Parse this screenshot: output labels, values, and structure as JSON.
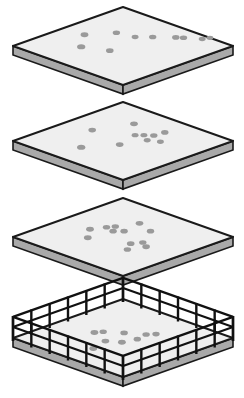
{
  "figure": {
    "title": "Stacked Isometric Platform Slabs",
    "canvas": {
      "width": 244,
      "height": 398
    },
    "colors": {
      "background": "#ffffff",
      "slab_top_fill": "#efefef",
      "slab_side_fill": "#a9a9a9",
      "outline": "#1a1a1a",
      "speck_fill": "#9a9a9a",
      "fence": "#111111"
    },
    "geometry": {
      "slab_half_width": 110,
      "slab_half_depth": 39,
      "slab_thickness": 9,
      "center_x": 123
    }
  },
  "chart_data": {
    "type": "diagram",
    "title": "Stacked Isometric Platform Slabs",
    "layers": [
      {
        "id": "slab-1",
        "label": "Top slab",
        "center_y": 46,
        "has_fence": false,
        "specks": [
          {
            "x": 0.47,
            "y": 0.18,
            "r": 3.4
          },
          {
            "x": 0.3,
            "y": 0.32,
            "r": 3.6
          },
          {
            "x": 0.64,
            "y": 0.3,
            "r": 3.2
          },
          {
            "x": 0.67,
            "y": 0.44,
            "r": 3.0
          },
          {
            "x": 0.38,
            "y": 0.5,
            "r": 3.3
          },
          {
            "x": 0.75,
            "y": 0.52,
            "r": 3.2
          },
          {
            "x": 0.85,
            "y": 0.63,
            "r": 3.2
          },
          {
            "x": 0.88,
            "y": 0.67,
            "r": 3.2
          },
          {
            "x": 0.95,
            "y": 0.77,
            "r": 3.0
          },
          {
            "x": 1.0,
            "y": 0.79,
            "r": 3.0
          }
        ]
      },
      {
        "id": "slab-2",
        "label": "Second slab",
        "center_y": 141,
        "has_fence": false,
        "specks": [
          {
            "x": 0.5,
            "y": 0.22,
            "r": 3.3
          },
          {
            "x": 0.23,
            "y": 0.39,
            "r": 3.6
          },
          {
            "x": 0.77,
            "y": 0.33,
            "r": 3.4
          },
          {
            "x": 0.44,
            "y": 0.53,
            "r": 3.3
          },
          {
            "x": 0.63,
            "y": 0.48,
            "r": 3.0
          },
          {
            "x": 0.67,
            "y": 0.52,
            "r": 3.0
          },
          {
            "x": 0.71,
            "y": 0.57,
            "r": 3.2
          },
          {
            "x": 0.62,
            "y": 0.6,
            "r": 3.0
          },
          {
            "x": 0.8,
            "y": 0.58,
            "r": 3.2
          },
          {
            "x": 0.66,
            "y": 0.68,
            "r": 3.0
          }
        ]
      },
      {
        "id": "slab-3",
        "label": "Third slab",
        "center_y": 237,
        "has_fence": false,
        "specks": [
          {
            "x": 0.45,
            "y": 0.25,
            "r": 3.4
          },
          {
            "x": 0.33,
            "y": 0.35,
            "r": 3.4
          },
          {
            "x": 0.55,
            "y": 0.3,
            "r": 3.2
          },
          {
            "x": 0.6,
            "y": 0.33,
            "r": 3.2
          },
          {
            "x": 0.53,
            "y": 0.38,
            "r": 3.2
          },
          {
            "x": 0.58,
            "y": 0.43,
            "r": 3.2
          },
          {
            "x": 0.75,
            "y": 0.4,
            "r": 3.3
          },
          {
            "x": 0.7,
            "y": 0.55,
            "r": 3.2
          },
          {
            "x": 0.45,
            "y": 0.62,
            "r": 3.3
          },
          {
            "x": 0.52,
            "y": 0.66,
            "r": 3.2
          },
          {
            "x": 0.36,
            "y": 0.68,
            "r": 3.2
          },
          {
            "x": 0.48,
            "y": 0.73,
            "r": 3.3
          }
        ]
      },
      {
        "id": "slab-4",
        "label": "Bottom slab with fence",
        "center_y": 338,
        "has_fence": true,
        "specks": [
          {
            "x": 0.44,
            "y": 0.3,
            "r": 3.4
          },
          {
            "x": 0.49,
            "y": 0.33,
            "r": 3.2
          },
          {
            "x": 0.57,
            "y": 0.44,
            "r": 3.3
          },
          {
            "x": 0.38,
            "y": 0.46,
            "r": 3.4
          },
          {
            "x": 0.44,
            "y": 0.55,
            "r": 3.4
          },
          {
            "x": 0.55,
            "y": 0.58,
            "r": 3.2
          },
          {
            "x": 0.65,
            "y": 0.56,
            "r": 3.2
          },
          {
            "x": 0.7,
            "y": 0.6,
            "r": 3.2
          },
          {
            "x": 0.23,
            "y": 0.5,
            "r": 3.4
          }
        ],
        "fence": {
          "post_height": 22,
          "post_width": 2.4,
          "posts_per_side": 6,
          "rail_count": 2,
          "rail_width": 2.2
        }
      }
    ]
  }
}
